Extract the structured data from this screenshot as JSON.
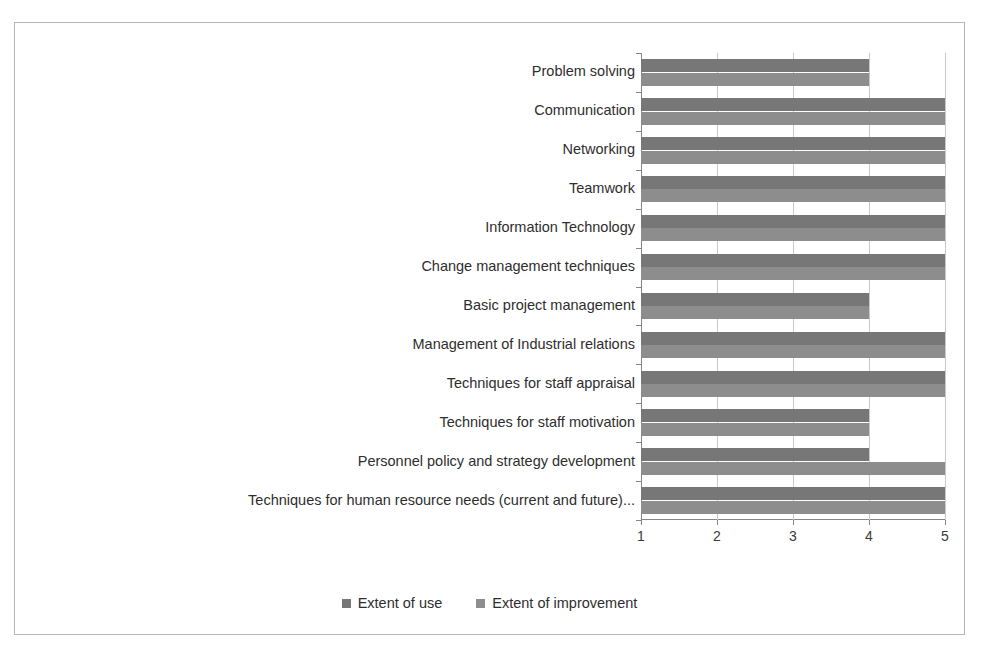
{
  "chart_data": {
    "type": "bar",
    "orientation": "horizontal",
    "title": "",
    "xlabel": "",
    "ylabel": "",
    "xlim": [
      1,
      5
    ],
    "xticks": [
      "1",
      "2",
      "3",
      "4",
      "5"
    ],
    "grid": true,
    "legend_position": "bottom",
    "categories": [
      "Problem solving",
      "Communication",
      "Networking",
      "Teamwork",
      "Information Technology",
      "Change management techniques",
      "Basic project management",
      "Management of Industrial relations",
      "Techniques for staff appraisal",
      "Techniques for staff motivation",
      "Personnel policy and strategy development",
      "Techniques for human resource needs (current and future)..."
    ],
    "series": [
      {
        "name": "Extent of use",
        "color": "#777777",
        "values": [
          4,
          5,
          5,
          5,
          5,
          5,
          4,
          5,
          5,
          4,
          4,
          5
        ]
      },
      {
        "name": "Extent of improvement",
        "color": "#8d8d8d",
        "values": [
          4,
          5,
          5,
          5,
          5,
          5,
          4,
          5,
          5,
          4,
          5,
          5
        ]
      }
    ]
  },
  "figure": {
    "border_color": "#b6b6b6",
    "background": "#ffffff",
    "axis_color": "#868686",
    "gridline_color": "#c9c9c9"
  }
}
